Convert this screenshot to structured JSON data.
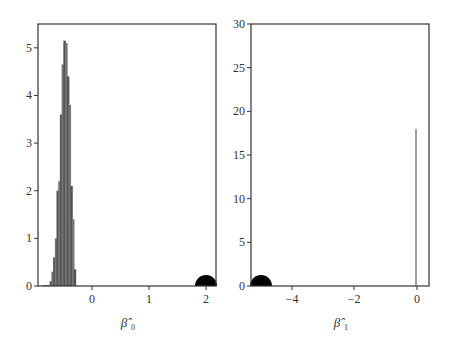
{
  "chart_data": [
    {
      "type": "bar",
      "title": "",
      "xlabel": "β̂0",
      "ylabel": "",
      "xlim": [
        -0.95,
        2.15
      ],
      "ylim": [
        0,
        5.5
      ],
      "xticks": [
        "0",
        "1",
        "2"
      ],
      "yticks": [
        "0",
        "1",
        "2",
        "3",
        "4",
        "5"
      ],
      "grid": false,
      "histogram_bins": {
        "x": [
          -0.85,
          -0.8,
          -0.75,
          -0.72,
          -0.69,
          -0.66,
          -0.63,
          -0.6,
          -0.57,
          -0.54,
          -0.51,
          -0.48,
          -0.45,
          -0.42,
          -0.39,
          -0.36,
          -0.33,
          -0.3
        ],
        "values": [
          0.02,
          0.02,
          0.02,
          0.1,
          0.3,
          0.6,
          1.0,
          2.0,
          2.2,
          3.6,
          4.65,
          5.15,
          5.1,
          4.4,
          3.8,
          2.1,
          1.4,
          0.35
        ]
      },
      "annotations": [
        {
          "type": "point-marker",
          "x": 2.0,
          "y": 0,
          "description": "large black semicircle marker at true value"
        }
      ],
      "x_labels_display": {
        "x": "β̂",
        "sub": "0"
      }
    },
    {
      "type": "bar",
      "title": "",
      "xlabel": "β̂1",
      "ylabel": "",
      "xlim": [
        -5.3,
        0.3
      ],
      "ylim": [
        0,
        30
      ],
      "xticks": [
        "−4",
        "−2",
        "0"
      ],
      "yticks": [
        "0",
        "5",
        "10",
        "15",
        "20",
        "25",
        "30"
      ],
      "grid": false,
      "histogram_bins": {
        "x": [
          0.0
        ],
        "values": [
          18
        ]
      },
      "annotations": [
        {
          "type": "point-marker",
          "x": -5.0,
          "y": 0,
          "description": "large black semicircle marker at true value"
        }
      ],
      "x_labels_display": {
        "x": "β̂",
        "sub": "1"
      }
    }
  ]
}
